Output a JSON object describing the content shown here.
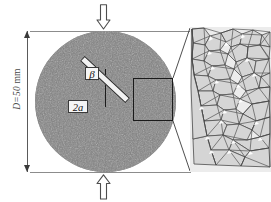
{
  "figure": {
    "background_color": "#ffffff"
  },
  "dimension": {
    "name": "diameter-dimension",
    "symbol": "D",
    "equals": "=",
    "value": "50",
    "unit": "mm",
    "full_label": "D=50 mm",
    "color": "#4a4a4a"
  },
  "loading": {
    "top_arrow_name": "load-arrow-down",
    "bottom_arrow_name": "load-arrow-up",
    "platen_color": "#8c8c8c",
    "arrow_fill": "#ffffff",
    "arrow_stroke": "#4d4d4d"
  },
  "specimen": {
    "name": "brazilian-disc",
    "shape": "circle",
    "fill_color": "#8a8a8a",
    "texture": "speckled-granular"
  },
  "flaw": {
    "name": "central-inclined-notch",
    "angle_label": "β",
    "length_label": "2a",
    "fill_color": "#f2f2f2",
    "outline_color": "#2e2e2e",
    "inclination_deg": 43,
    "reference_line_color": "#1c1c1c"
  },
  "callout": {
    "name": "microstructure-callout-region",
    "outline_color": "#1a1a1a",
    "leader_color": "#3a3a3a"
  },
  "microstructure": {
    "name": "grain-structure-inset",
    "description": "polygonal grain / Voronoi mesh",
    "grain_fill": "#d7d7d7",
    "grain_edge": "#4a4a4a",
    "void_fill": "#ffffff",
    "panel_background": "#e4e4e4"
  }
}
